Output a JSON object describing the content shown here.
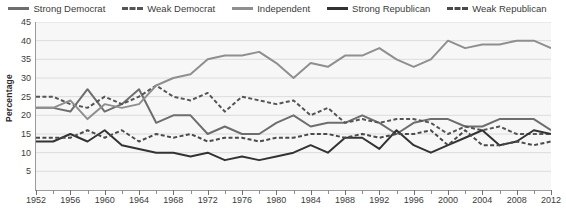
{
  "chart_data": {
    "type": "line",
    "title": "",
    "xlabel": "",
    "ylabel": "Percentage",
    "xlim": [
      1952,
      2012
    ],
    "ylim": [
      0,
      45
    ],
    "yticks": [
      5,
      10,
      15,
      20,
      25,
      30,
      35,
      40,
      45
    ],
    "xticks": [
      1952,
      1956,
      1960,
      1964,
      1968,
      1972,
      1976,
      1980,
      1984,
      1988,
      1992,
      1996,
      2000,
      2004,
      2008,
      2012
    ],
    "xtick_labels": [
      "1952",
      "1956",
      "1960",
      "1964",
      "1968",
      "1972",
      "1976",
      "1980",
      "1984",
      "1988",
      "1992",
      "1996",
      "2000",
      "2004",
      "2008",
      "2012"
    ],
    "x": [
      1952,
      1954,
      1956,
      1958,
      1960,
      1962,
      1964,
      1966,
      1968,
      1970,
      1972,
      1974,
      1976,
      1978,
      1980,
      1982,
      1984,
      1986,
      1988,
      1990,
      1992,
      1994,
      1996,
      1998,
      2000,
      2002,
      2004,
      2006,
      2008,
      2010,
      2012
    ],
    "grid": true,
    "grid_axis": "y",
    "legend_position": "top",
    "series": [
      {
        "name": "Strong Democrat",
        "style": "solid",
        "color": "#6e6e6e",
        "values": [
          22,
          22,
          21,
          27,
          21,
          23,
          27,
          18,
          20,
          20,
          15,
          17,
          15,
          15,
          18,
          20,
          17,
          18,
          18,
          20,
          18,
          15,
          18,
          19,
          19,
          17,
          17,
          19,
          19,
          19,
          16
        ]
      },
      {
        "name": "Weak Democrat",
        "style": "dashed",
        "color": "#555555",
        "values": [
          25,
          25,
          23,
          22,
          25,
          23,
          25,
          28,
          25,
          24,
          26,
          21,
          25,
          24,
          23,
          24,
          20,
          22,
          18,
          19,
          18,
          19,
          19,
          18,
          15,
          17,
          16,
          17,
          15,
          15,
          15
        ]
      },
      {
        "name": "Independent",
        "style": "solid",
        "color": "#8f8f8f",
        "values": [
          22,
          22,
          24,
          19,
          23,
          22,
          23,
          28,
          30,
          31,
          35,
          36,
          36,
          37,
          34,
          30,
          34,
          33,
          36,
          36,
          38,
          35,
          33,
          35,
          40,
          38,
          39,
          39,
          40,
          40,
          38
        ]
      },
      {
        "name": "Strong Republican",
        "style": "solid",
        "color": "#333333",
        "values": [
          13,
          13,
          15,
          13,
          16,
          12,
          11,
          10,
          10,
          9,
          10,
          8,
          9,
          8,
          9,
          10,
          12,
          10,
          14,
          14,
          11,
          16,
          12,
          10,
          12,
          14,
          16,
          12,
          13,
          16,
          15
        ]
      },
      {
        "name": "Weak Republican",
        "style": "dashed",
        "color": "#4a4a4a",
        "values": [
          14,
          14,
          14,
          16,
          14,
          16,
          13,
          15,
          14,
          15,
          13,
          14,
          14,
          13,
          14,
          14,
          15,
          15,
          14,
          15,
          14,
          15,
          15,
          16,
          12,
          16,
          12,
          12,
          13,
          12,
          13
        ]
      }
    ]
  },
  "legend": {
    "items": [
      {
        "label": "Strong Democrat",
        "style": "solid",
        "color": "#6e6e6e"
      },
      {
        "label": "Weak Democrat",
        "style": "dashed",
        "color": "#555555"
      },
      {
        "label": "Independent",
        "style": "solid",
        "color": "#8f8f8f"
      },
      {
        "label": "Strong Republican",
        "style": "solid",
        "color": "#333333"
      },
      {
        "label": "Weak Republican",
        "style": "dashed",
        "color": "#4a4a4a"
      }
    ]
  }
}
